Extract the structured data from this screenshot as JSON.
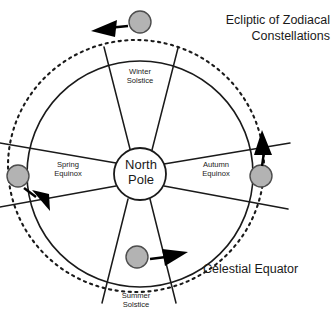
{
  "diagram": {
    "title": "Ecliptic of Zodiacal\nConstellations",
    "caption": "Celestial Equator",
    "hub_label": "North\nPole",
    "sector_labels": {
      "winter": "Winter\nSolstice",
      "summer": "Summer\nSolstice",
      "spring": "Spring\nEquinox",
      "autumn": "Autumn\nEquinox"
    },
    "colors": {
      "background": "#ffffff",
      "line": "#1a1a1a",
      "sun_fill": "#b3b3b3",
      "sun_stroke": "#4d4d4d",
      "arrow_fill": "#000000",
      "text": "#1a1a1a"
    },
    "geometry": {
      "center": {
        "x": 140,
        "y": 174
      },
      "equator_radius": 113,
      "hub_radius": 26,
      "ecliptic": {
        "cx": 136,
        "cy": 166,
        "rx": 128,
        "ry": 126
      }
    },
    "sun_markers": [
      {
        "name": "sun-top",
        "x": 140,
        "y": 22,
        "r": 11
      },
      {
        "name": "sun-left",
        "x": 18,
        "y": 176,
        "r": 11
      },
      {
        "name": "sun-right",
        "x": 261,
        "y": 176,
        "r": 11
      },
      {
        "name": "sun-bottom",
        "x": 137,
        "y": 257,
        "r": 11
      }
    ],
    "arrows": [
      {
        "name": "arrow-top",
        "direction": "left"
      },
      {
        "name": "arrow-left",
        "direction": "down-left"
      },
      {
        "name": "arrow-right",
        "direction": "up"
      },
      {
        "name": "arrow-bottom",
        "direction": "right"
      }
    ]
  }
}
